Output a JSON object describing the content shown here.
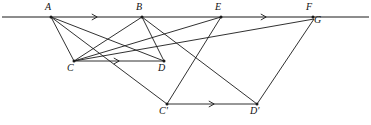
{
  "figure": {
    "background_color": "#ffffff",
    "stroke_color": "#1a1a1a",
    "canvas": {
      "width": 371,
      "height": 125
    }
  },
  "points": [
    {
      "id": "A",
      "label": "A",
      "x": 51,
      "y": 17,
      "label_x": 45,
      "label_y": 2,
      "on_baseline": true
    },
    {
      "id": "B",
      "label": "B",
      "x": 142,
      "y": 17,
      "label_x": 136,
      "label_y": 2,
      "on_baseline": true
    },
    {
      "id": "E",
      "label": "E",
      "x": 221,
      "y": 17,
      "label_x": 215,
      "label_y": 2,
      "on_baseline": true
    },
    {
      "id": "F",
      "label": "F",
      "x": 313,
      "y": 17,
      "label_x": 306,
      "label_y": 2,
      "on_baseline": true
    },
    {
      "id": "G",
      "label": "G",
      "x": 314,
      "y": 19,
      "label_x": 314,
      "label_y": 15,
      "on_baseline": false
    },
    {
      "id": "C",
      "label": "C",
      "x": 74,
      "y": 61,
      "label_x": 67,
      "label_y": 63,
      "on_baseline": false
    },
    {
      "id": "D",
      "label": "D",
      "x": 164,
      "y": 61,
      "label_x": 158,
      "label_y": 63,
      "on_baseline": false
    },
    {
      "id": "Cp",
      "label": "C'",
      "x": 167,
      "y": 104,
      "label_x": 159,
      "label_y": 106,
      "on_baseline": false
    },
    {
      "id": "Dp",
      "label": "D'",
      "x": 257,
      "y": 104,
      "label_x": 250,
      "label_y": 106,
      "on_baseline": false
    }
  ],
  "baseline": {
    "name": "transversal-line",
    "x1": 2,
    "y1": 17,
    "x2": 369,
    "y2": 17,
    "arrow_positions": [
      96,
      265
    ]
  },
  "segments": [
    {
      "id": "A-C",
      "from": "A",
      "to": "C",
      "arrow": false
    },
    {
      "id": "A-D",
      "from": "A",
      "to": "D",
      "arrow": false
    },
    {
      "id": "A-Cp",
      "from": "A",
      "to": "Cp",
      "arrow": false
    },
    {
      "id": "B-C",
      "from": "B",
      "to": "C",
      "arrow": false
    },
    {
      "id": "B-D",
      "from": "B",
      "to": "D",
      "arrow": false
    },
    {
      "id": "B-Dp",
      "from": "B",
      "to": "Dp",
      "arrow": false
    },
    {
      "id": "E-C",
      "from": "E",
      "to": "C",
      "arrow": false
    },
    {
      "id": "E-Cp",
      "from": "E",
      "to": "Cp",
      "arrow": false
    },
    {
      "id": "C-G",
      "from": "C",
      "to": "G",
      "arrow": false
    },
    {
      "id": "G-Dp",
      "from": "G",
      "to": "Dp",
      "arrow": false
    },
    {
      "id": "C-D",
      "from": "C",
      "to": "D",
      "arrow": true,
      "arrow_at": 0.49
    },
    {
      "id": "Cp-Dp",
      "from": "Cp",
      "to": "Dp",
      "arrow": true,
      "arrow_at": 0.51
    }
  ],
  "arrow_markers": {
    "baseline_arrow_1": {
      "x": 96,
      "y": 17,
      "direction": "right"
    },
    "baseline_arrow_2": {
      "x": 265,
      "y": 17,
      "direction": "right"
    },
    "cd_arrow": {
      "x": 118,
      "y": 61,
      "direction": "right"
    },
    "cpdp_arrow": {
      "x": 213,
      "y": 104,
      "direction": "right"
    }
  }
}
